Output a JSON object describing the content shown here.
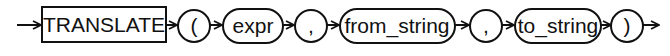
{
  "diagram": {
    "type": "railroad-syntax",
    "function_name": "TRANSLATE",
    "elements": [
      {
        "kind": "keyword",
        "label": "TRANSLATE"
      },
      {
        "kind": "terminal",
        "label": "("
      },
      {
        "kind": "nonterminal",
        "label": "expr"
      },
      {
        "kind": "terminal",
        "label": ","
      },
      {
        "kind": "nonterminal",
        "label": "from_string"
      },
      {
        "kind": "terminal",
        "label": ","
      },
      {
        "kind": "nonterminal",
        "label": "to_string"
      },
      {
        "kind": "terminal",
        "label": ")"
      }
    ],
    "colors": {
      "line": "#111111",
      "background": "#ffffff"
    }
  }
}
